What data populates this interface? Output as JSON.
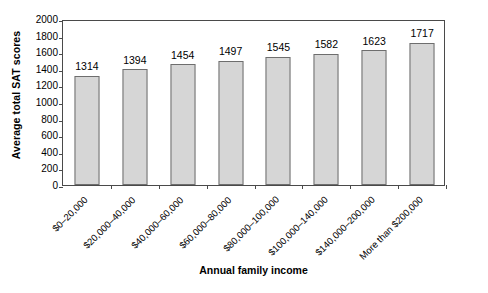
{
  "chart_data": {
    "type": "bar",
    "title": "",
    "xlabel": "Annual family income",
    "ylabel": "Average total SAT scores",
    "categories": [
      "$0–20,000",
      "$20,000–40,000",
      "$40,000–60,000",
      "$60,000–80,000",
      "$80,000–100,000",
      "$100,000–140,000",
      "$140,000–200,000",
      "More than $200,000"
    ],
    "values": [
      1314,
      1394,
      1454,
      1497,
      1545,
      1582,
      1623,
      1717
    ],
    "value_labels": [
      "1314",
      "1394",
      "1454",
      "1497",
      "1545",
      "1582",
      "1623",
      "1717"
    ],
    "ylim": [
      0,
      2000
    ],
    "yticks": [
      2000,
      1800,
      1600,
      1400,
      1200,
      1000,
      800,
      600,
      400,
      200,
      0
    ],
    "ytick_labels": [
      "2000",
      "1800",
      "1600",
      "1400",
      "1200",
      "1000",
      "800",
      "600",
      "400",
      "200",
      "0"
    ],
    "grid": false,
    "legend": "none",
    "bar_fill_color": "#d6d6d6",
    "bar_border_color": "#6e6e6e",
    "axis_color": "#4a4a4a",
    "background_color": "#ffffff"
  }
}
